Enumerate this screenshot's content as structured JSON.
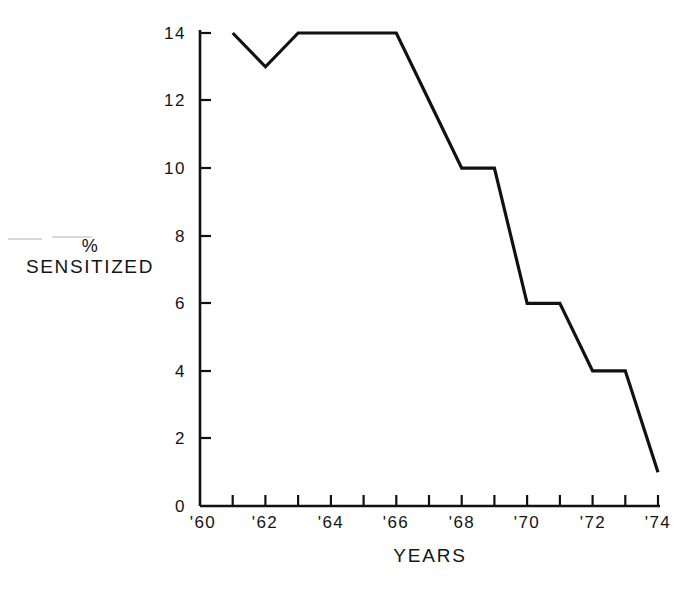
{
  "chart_data": {
    "type": "line",
    "title": "",
    "subtitle": "",
    "xlabel": "YEARS",
    "ylabel": "% SENSITIZED",
    "ylabel_lines": [
      "%",
      "SENSITIZED"
    ],
    "x": [
      1961,
      1962,
      1963,
      1964,
      1965,
      1966,
      1967,
      1968,
      1969,
      1970,
      1971,
      1972,
      1973,
      1974
    ],
    "values": [
      14,
      13,
      14,
      14,
      14,
      14,
      12,
      10,
      10,
      6,
      6,
      4,
      4,
      1
    ],
    "series": [
      {
        "name": "% Sensitized",
        "values": [
          14,
          13,
          14,
          14,
          14,
          14,
          12,
          10,
          10,
          6,
          6,
          4,
          4,
          1
        ]
      }
    ],
    "xlim": [
      1960,
      1974
    ],
    "ylim": [
      0,
      14
    ],
    "grid": false,
    "legend": false,
    "legend_position": "none",
    "line_color": "#111111",
    "background_color": "#ffffff",
    "x_tick_values": [
      1960,
      1961,
      1962,
      1963,
      1964,
      1965,
      1966,
      1967,
      1968,
      1969,
      1970,
      1971,
      1972,
      1973,
      1974
    ],
    "x_tick_labels": [
      "'60",
      "",
      "'62",
      "",
      "'64",
      "",
      "'66",
      "",
      "'68",
      "",
      "'70",
      "",
      "'72",
      "",
      "'74"
    ],
    "y_tick_values": [
      0,
      2,
      4,
      6,
      8,
      10,
      12,
      14
    ],
    "y_tick_labels": [
      "0",
      "2",
      "4",
      "6",
      "8",
      "10",
      "12",
      "14"
    ],
    "annotations": []
  },
  "axis": {
    "y_ticks": [
      {
        "value": 14,
        "label": "14"
      },
      {
        "value": 12,
        "label": "12"
      },
      {
        "value": 10,
        "label": "10"
      },
      {
        "value": 8,
        "label": "8"
      },
      {
        "value": 6,
        "label": "6"
      },
      {
        "value": 4,
        "label": "4"
      },
      {
        "value": 2,
        "label": "2"
      },
      {
        "value": 0,
        "label": "0"
      }
    ],
    "x_ticks": [
      {
        "value": 1960,
        "label": "'60"
      },
      {
        "value": 1962,
        "label": "'62"
      },
      {
        "value": 1964,
        "label": "'64"
      },
      {
        "value": 1966,
        "label": "'66"
      },
      {
        "value": 1968,
        "label": "'68"
      },
      {
        "value": 1970,
        "label": "'70"
      },
      {
        "value": 1972,
        "label": "'72"
      },
      {
        "value": 1974,
        "label": "'74"
      }
    ]
  },
  "labels": {
    "y_axis_symbol": "%",
    "y_axis_name": "SENSITIZED",
    "x_axis_name": "YEARS"
  }
}
